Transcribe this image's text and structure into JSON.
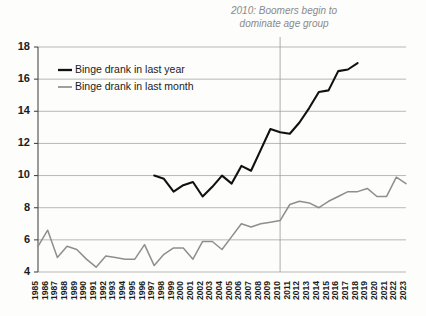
{
  "chart_data": {
    "type": "line",
    "title": "",
    "xlabel": "",
    "ylabel": "",
    "ylim": [
      4,
      18
    ],
    "yticks": [
      4,
      6,
      8,
      10,
      12,
      14,
      16,
      18
    ],
    "ytick_labels": [
      "4",
      "6",
      "8",
      "10",
      "12",
      "14",
      "16",
      "18"
    ],
    "grid": true,
    "legend_position": "upper-left",
    "x": [
      1985,
      1986,
      1987,
      1988,
      1989,
      1990,
      1991,
      1992,
      1993,
      1994,
      1995,
      1996,
      1997,
      1998,
      1999,
      2000,
      2001,
      2002,
      2003,
      2004,
      2005,
      2006,
      2007,
      2008,
      2009,
      2010,
      2011,
      2012,
      2013,
      2014,
      2015,
      2016,
      2017,
      2018,
      2019,
      2020,
      2021,
      2022,
      2023
    ],
    "xtick_labels": [
      "1985",
      "1986",
      "1987",
      "1988",
      "1989",
      "1990",
      "1991",
      "1992",
      "1993",
      "1994",
      "1995",
      "1996",
      "1997",
      "1998",
      "1999",
      "2000",
      "2001",
      "2002",
      "2003",
      "2004",
      "2005",
      "2006",
      "2007",
      "2008",
      "2009",
      "2010",
      "2011",
      "2012",
      "2013",
      "2014",
      "2015",
      "2016",
      "2017",
      "2018",
      "2019",
      "2020",
      "2021",
      "2022",
      "2023"
    ],
    "series": [
      {
        "name": "Binge drank in last year",
        "color": "#111111",
        "x": [
          1997,
          1998,
          1999,
          2000,
          2001,
          2002,
          2003,
          2004,
          2005,
          2006,
          2007,
          2008,
          2009,
          2010,
          2011,
          2012,
          2013,
          2014,
          2015,
          2016,
          2017,
          2018
        ],
        "values": [
          10.0,
          9.8,
          9.0,
          9.4,
          9.6,
          8.7,
          9.3,
          10.0,
          9.5,
          10.6,
          10.3,
          11.6,
          12.9,
          12.7,
          12.6,
          13.3,
          14.2,
          15.2,
          15.3,
          16.5,
          16.6,
          17.0
        ]
      },
      {
        "name": "Binge drank in last month",
        "color": "#8e8e8e",
        "x": [
          1985,
          1986,
          1987,
          1988,
          1989,
          1990,
          1991,
          1992,
          1993,
          1994,
          1995,
          1996,
          1997,
          1998,
          1999,
          2000,
          2001,
          2002,
          2003,
          2004,
          2005,
          2006,
          2007,
          2008,
          2009,
          2010,
          2011,
          2012,
          2013,
          2014,
          2015,
          2016,
          2017,
          2018,
          2019,
          2020,
          2021,
          2022,
          2023
        ],
        "values": [
          5.6,
          6.6,
          4.9,
          5.6,
          5.4,
          4.8,
          4.3,
          5.0,
          4.9,
          4.8,
          4.8,
          5.7,
          4.4,
          5.1,
          5.5,
          5.5,
          4.8,
          5.9,
          5.9,
          5.4,
          6.2,
          7.0,
          6.8,
          7.0,
          7.1,
          7.2,
          8.2,
          8.4,
          8.3,
          8.0,
          8.4,
          8.7,
          9.0,
          9.0,
          9.2,
          8.7,
          8.7,
          9.9,
          9.5
        ]
      }
    ],
    "annotations": [
      {
        "name": "boomers-annotation",
        "x_value": 2010,
        "line1": "2010: Boomers begin to",
        "line2": "dominate age group",
        "color": "#8a8a8a",
        "has_vertical_line": true
      }
    ]
  },
  "legend": {
    "items": [
      {
        "label": "Binge drank in last year"
      },
      {
        "label": "Binge drank in last month"
      }
    ]
  }
}
